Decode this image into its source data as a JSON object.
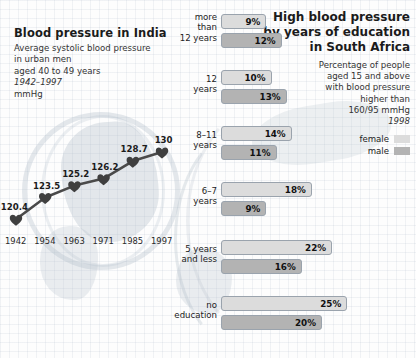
{
  "left": {
    "title": "Blood pressure in India",
    "subtitle_lines": [
      "Average systolic blood pressure",
      "in urban men",
      "aged 40 to 49 years"
    ],
    "period": "1942–1997",
    "unit": "mmHg"
  },
  "right": {
    "title_lines": [
      "High blood pressure",
      "by years of education",
      "in South Africa"
    ],
    "subtitle_lines": [
      "Percentage of people",
      "aged 15 and above",
      "with blood pressure",
      "higher than",
      "160/95 mmHg"
    ],
    "year": "1998",
    "legend": [
      {
        "label": "female",
        "color": "#dcdcdc"
      },
      {
        "label": "male",
        "color": "#b3b3b3"
      }
    ]
  },
  "chart_data": [
    {
      "type": "line",
      "title": "Blood pressure in India",
      "subtitle": "Average systolic blood pressure in urban men aged 40 to 49 years",
      "xlabel": "",
      "ylabel": "mmHg",
      "period": "1942–1997",
      "categories": [
        "1942",
        "1954",
        "1963",
        "1971",
        "1985",
        "1997"
      ],
      "values": [
        120.4,
        123.5,
        125.2,
        126.2,
        128.7,
        130
      ],
      "value_labels": [
        "120.4",
        "123.5",
        "125.2",
        "126.2",
        "128.7",
        "130"
      ],
      "marker": "heart",
      "line_color": "#4a4a4a",
      "grid": false,
      "ylim": [
        118,
        132
      ]
    },
    {
      "type": "bar",
      "orientation": "horizontal",
      "title": "High blood pressure by years of education in South Africa",
      "subtitle": "Percentage of people aged 15 and above with blood pressure higher than 160/95 mmHg",
      "year": "1998",
      "xlabel": "",
      "ylabel": "",
      "unit": "%",
      "categories": [
        "more\nthan\n12 years",
        "12\nyears",
        "8–11\nyears",
        "6–7\nyears",
        "5 years\nand less",
        "no\neducation"
      ],
      "series": [
        {
          "name": "female",
          "color": "#dcdcdc",
          "values": [
            9,
            10,
            14,
            18,
            22,
            25
          ],
          "labels": [
            "9%",
            "10%",
            "14%",
            "18%",
            "22%",
            "25%"
          ]
        },
        {
          "name": "male",
          "color": "#b3b3b3",
          "values": [
            12,
            13,
            11,
            9,
            16,
            20
          ],
          "labels": [
            "12%",
            "13%",
            "11%",
            "9%",
            "16%",
            "20%"
          ]
        }
      ],
      "xlim": [
        0,
        26
      ],
      "grid": false,
      "legend_position": "top-right"
    }
  ]
}
